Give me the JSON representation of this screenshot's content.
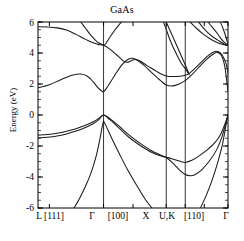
{
  "chart_data": {
    "type": "line",
    "title": "GaAs",
    "xlabel": "",
    "ylabel": "Energy (eV)",
    "ylim": [
      -6,
      6
    ],
    "yticks": [
      6,
      4,
      2,
      0,
      -2,
      -4,
      -6
    ],
    "ytick_labels": [
      "6",
      "4",
      "2",
      "0",
      "-2",
      "-4",
      "-6"
    ],
    "y_minor_step": 0.5,
    "grid": false,
    "legend": "none",
    "x_symmetry_points": [
      {
        "label": "L",
        "pos": 0.0
      },
      {
        "label": "Γ",
        "pos": 0.345
      },
      {
        "label": "X",
        "pos": 0.675
      },
      {
        "label": "U,K",
        "pos": 0.775
      },
      {
        "label": "Γ",
        "pos": 1.0
      }
    ],
    "xtick_labels": [
      "L [111]",
      "Γ",
      "[100]",
      "X",
      "U,K",
      "[110]",
      "Γ"
    ],
    "xtick_positions": [
      0.06,
      0.345,
      0.5,
      0.675,
      0.775,
      0.875,
      1.0
    ],
    "vertical_lines": [
      0.345,
      0.675,
      0.775
    ],
    "series": [
      {
        "name": "valence-band-heavy-hole",
        "points": [
          [
            0.0,
            -1.3
          ],
          [
            0.05,
            -1.26
          ],
          [
            0.1,
            -1.18
          ],
          [
            0.15,
            -1.05
          ],
          [
            0.2,
            -0.88
          ],
          [
            0.25,
            -0.66
          ],
          [
            0.29,
            -0.44
          ],
          [
            0.32,
            -0.22
          ],
          [
            0.345,
            0.0
          ],
          [
            0.38,
            -0.25
          ],
          [
            0.43,
            -0.75
          ],
          [
            0.48,
            -1.3
          ],
          [
            0.54,
            -1.85
          ],
          [
            0.6,
            -2.32
          ],
          [
            0.66,
            -2.66
          ],
          [
            0.675,
            -2.72
          ],
          [
            0.7,
            -2.8
          ],
          [
            0.73,
            -2.92
          ],
          [
            0.755,
            -3.02
          ],
          [
            0.775,
            -3.06
          ],
          [
            0.81,
            -2.92
          ],
          [
            0.85,
            -2.62
          ],
          [
            0.89,
            -2.25
          ],
          [
            0.93,
            -1.8
          ],
          [
            0.96,
            -1.28
          ],
          [
            0.985,
            -0.55
          ],
          [
            1.0,
            0.0
          ]
        ]
      },
      {
        "name": "valence-band-light-hole",
        "points": [
          [
            0.0,
            -1.48
          ],
          [
            0.05,
            -1.44
          ],
          [
            0.1,
            -1.36
          ],
          [
            0.15,
            -1.22
          ],
          [
            0.2,
            -1.04
          ],
          [
            0.25,
            -0.8
          ],
          [
            0.29,
            -0.56
          ],
          [
            0.32,
            -0.3
          ],
          [
            0.345,
            0.0
          ],
          [
            0.38,
            -0.32
          ],
          [
            0.43,
            -0.88
          ],
          [
            0.48,
            -1.45
          ],
          [
            0.54,
            -1.98
          ],
          [
            0.6,
            -2.42
          ],
          [
            0.66,
            -2.7
          ],
          [
            0.675,
            -2.74
          ],
          [
            0.71,
            -3.1
          ],
          [
            0.745,
            -3.55
          ],
          [
            0.775,
            -3.84
          ],
          [
            0.8,
            -3.92
          ],
          [
            0.825,
            -3.86
          ],
          [
            0.86,
            -3.55
          ],
          [
            0.9,
            -3.0
          ],
          [
            0.94,
            -2.25
          ],
          [
            0.97,
            -1.35
          ],
          [
            1.0,
            0.0
          ]
        ]
      },
      {
        "name": "valence-band-split-off",
        "points": [
          [
            0.345,
            -0.38
          ],
          [
            0.36,
            -0.75
          ],
          [
            0.39,
            -1.55
          ],
          [
            0.43,
            -2.55
          ],
          [
            0.47,
            -3.5
          ],
          [
            0.52,
            -4.55
          ],
          [
            0.565,
            -5.45
          ],
          [
            0.6,
            -6.0
          ]
        ]
      },
      {
        "name": "valence-band-lower-left",
        "points": [
          [
            0.19,
            -6.0
          ],
          [
            0.22,
            -5.35
          ],
          [
            0.25,
            -4.6
          ],
          [
            0.28,
            -3.7
          ],
          [
            0.305,
            -2.7
          ],
          [
            0.325,
            -1.6
          ],
          [
            0.338,
            -0.75
          ],
          [
            0.345,
            -0.38
          ]
        ]
      },
      {
        "name": "valence-band-lower-right",
        "points": [
          [
            0.855,
            -6.0
          ],
          [
            0.885,
            -5.2
          ],
          [
            0.915,
            -4.25
          ],
          [
            0.945,
            -3.1
          ],
          [
            0.97,
            -1.95
          ],
          [
            0.99,
            -0.6
          ],
          [
            1.0,
            0.0
          ]
        ]
      },
      {
        "name": "conduction-band-1",
        "points": [
          [
            0.0,
            1.75
          ],
          [
            0.06,
            1.95
          ],
          [
            0.12,
            2.28
          ],
          [
            0.18,
            2.56
          ],
          [
            0.225,
            2.64
          ],
          [
            0.26,
            2.5
          ],
          [
            0.29,
            2.15
          ],
          [
            0.315,
            1.76
          ],
          [
            0.335,
            1.55
          ],
          [
            0.345,
            1.5
          ],
          [
            0.36,
            1.72
          ],
          [
            0.4,
            2.48
          ],
          [
            0.44,
            3.22
          ],
          [
            0.475,
            3.6
          ],
          [
            0.5,
            3.66
          ],
          [
            0.525,
            3.52
          ],
          [
            0.56,
            3.18
          ],
          [
            0.6,
            2.72
          ],
          [
            0.645,
            2.22
          ],
          [
            0.675,
            1.94
          ],
          [
            0.71,
            1.88
          ],
          [
            0.745,
            2.02
          ],
          [
            0.775,
            2.22
          ],
          [
            0.81,
            2.6
          ],
          [
            0.85,
            3.12
          ],
          [
            0.89,
            3.62
          ],
          [
            0.925,
            3.95
          ],
          [
            0.945,
            4.04
          ],
          [
            0.965,
            3.85
          ],
          [
            0.982,
            3.2
          ],
          [
            0.995,
            2.05
          ],
          [
            1.0,
            1.52
          ]
        ]
      },
      {
        "name": "conduction-band-2",
        "points": [
          [
            0.0,
            5.7
          ],
          [
            0.05,
            5.68
          ],
          [
            0.1,
            5.62
          ],
          [
            0.15,
            5.48
          ],
          [
            0.2,
            5.2
          ],
          [
            0.25,
            4.88
          ],
          [
            0.29,
            4.66
          ],
          [
            0.32,
            4.54
          ],
          [
            0.345,
            4.5
          ],
          [
            0.375,
            4.28
          ],
          [
            0.41,
            3.92
          ],
          [
            0.45,
            3.48
          ],
          [
            0.47,
            3.4
          ],
          [
            0.49,
            3.5
          ],
          [
            0.51,
            3.58
          ],
          [
            0.535,
            3.5
          ],
          [
            0.57,
            3.22
          ],
          [
            0.61,
            2.92
          ],
          [
            0.645,
            2.66
          ],
          [
            0.675,
            2.52
          ],
          [
            0.71,
            2.48
          ],
          [
            0.745,
            2.5
          ],
          [
            0.775,
            2.56
          ],
          [
            0.8,
            2.72
          ],
          [
            0.83,
            3.05
          ],
          [
            0.865,
            3.48
          ],
          [
            0.9,
            3.88
          ],
          [
            0.93,
            4.1
          ],
          [
            0.95,
            4.08
          ],
          [
            0.97,
            3.85
          ],
          [
            0.99,
            3.3
          ],
          [
            1.0,
            2.7
          ]
        ]
      },
      {
        "name": "conduction-band-3",
        "points": [
          [
            0.225,
            6.0
          ],
          [
            0.25,
            5.6
          ],
          [
            0.28,
            5.12
          ],
          [
            0.31,
            4.74
          ],
          [
            0.335,
            4.56
          ],
          [
            0.345,
            4.5
          ],
          [
            0.355,
            4.58
          ],
          [
            0.375,
            4.95
          ],
          [
            0.4,
            5.4
          ],
          [
            0.425,
            5.8
          ],
          [
            0.44,
            6.0
          ]
        ]
      },
      {
        "name": "conduction-band-4",
        "points": [
          [
            0.66,
            6.0
          ],
          [
            0.675,
            5.52
          ],
          [
            0.69,
            5.0
          ],
          [
            0.71,
            4.4
          ],
          [
            0.735,
            3.78
          ],
          [
            0.755,
            3.32
          ],
          [
            0.775,
            3.0
          ],
          [
            0.79,
            2.8
          ],
          [
            0.675,
            6.0
          ]
        ]
      },
      {
        "name": "conduction-band-5-right",
        "points": [
          [
            0.845,
            6.0
          ],
          [
            0.87,
            5.62
          ],
          [
            0.895,
            5.3
          ],
          [
            0.925,
            5.0
          ],
          [
            0.955,
            4.76
          ],
          [
            0.98,
            4.58
          ],
          [
            1.0,
            4.5
          ]
        ]
      },
      {
        "name": "conduction-band-6-right",
        "points": [
          [
            0.8,
            6.0
          ],
          [
            0.835,
            5.58
          ],
          [
            0.87,
            5.22
          ],
          [
            0.905,
            4.92
          ],
          [
            0.94,
            4.7
          ],
          [
            0.97,
            4.56
          ],
          [
            1.0,
            4.48
          ]
        ]
      },
      {
        "name": "conduction-band-7-right",
        "points": [
          [
            0.895,
            6.0
          ],
          [
            0.915,
            5.7
          ],
          [
            0.94,
            5.32
          ],
          [
            0.96,
            4.98
          ],
          [
            0.98,
            4.7
          ],
          [
            1.0,
            4.5
          ]
        ]
      },
      {
        "name": "conduction-band-8-right",
        "points": [
          [
            0.96,
            6.0
          ],
          [
            0.975,
            5.55
          ],
          [
            0.99,
            5.0
          ],
          [
            1.0,
            4.56
          ]
        ]
      }
    ]
  },
  "axes": {
    "frame_color": "#000000",
    "line_color": "#1a1a1a"
  }
}
